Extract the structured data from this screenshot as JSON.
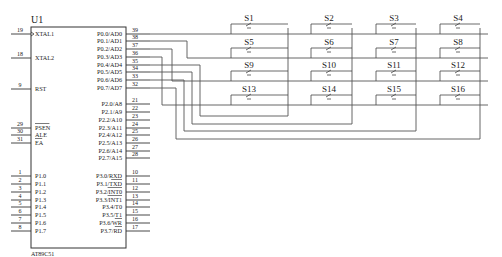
{
  "chip": {
    "ref": "U1",
    "part": "AT89C51",
    "left_pins": [
      {
        "num": "19",
        "name": "XTAL1",
        "y": 34,
        "clock": true
      },
      {
        "num": "18",
        "name": "XTAL2",
        "y": 58
      },
      {
        "num": "9",
        "name": "RST",
        "y": 89
      },
      {
        "num": "29",
        "name": "PSEN",
        "y": 128,
        "overbar": true
      },
      {
        "num": "30",
        "name": "ALE",
        "y": 135
      },
      {
        "num": "31",
        "name": "EA",
        "y": 143,
        "overbar": true
      },
      {
        "num": "1",
        "name": "P1.0",
        "y": 176
      },
      {
        "num": "2",
        "name": "P1.1",
        "y": 184
      },
      {
        "num": "3",
        "name": "P1.2",
        "y": 192
      },
      {
        "num": "4",
        "name": "P1.3",
        "y": 200
      },
      {
        "num": "5",
        "name": "P1.4",
        "y": 207
      },
      {
        "num": "6",
        "name": "P1.5",
        "y": 215
      },
      {
        "num": "7",
        "name": "P1.6",
        "y": 223
      },
      {
        "num": "8",
        "name": "P1.7",
        "y": 231
      }
    ],
    "right_pins": [
      {
        "num": "39",
        "name": "P0.0/AD0",
        "y": 34
      },
      {
        "num": "38",
        "name": "P0.1/AD1",
        "y": 41
      },
      {
        "num": "37",
        "name": "P0.2/AD2",
        "y": 49
      },
      {
        "num": "36",
        "name": "P0.3/AD3",
        "y": 57
      },
      {
        "num": "35",
        "name": "P0.4/AD4",
        "y": 65
      },
      {
        "num": "34",
        "name": "P0.5/AD5",
        "y": 72
      },
      {
        "num": "33",
        "name": "P0.6/AD6",
        "y": 80
      },
      {
        "num": "32",
        "name": "P0.7/AD7",
        "y": 88
      },
      {
        "num": "21",
        "name": "P2.0/A8",
        "y": 104
      },
      {
        "num": "22",
        "name": "P2.1/A9",
        "y": 112
      },
      {
        "num": "23",
        "name": "P2.2/A10",
        "y": 120
      },
      {
        "num": "24",
        "name": "P2.3/A11",
        "y": 128
      },
      {
        "num": "25",
        "name": "P2.4/A12",
        "y": 135
      },
      {
        "num": "26",
        "name": "P2.5/A13",
        "y": 143
      },
      {
        "num": "27",
        "name": "P2.6/A14",
        "y": 151
      },
      {
        "num": "28",
        "name": "P2.7/A15",
        "y": 158
      },
      {
        "num": "10",
        "name": "P3.0/RXD",
        "y": 176
      },
      {
        "num": "11",
        "name": "P3.1/TXD",
        "y": 184,
        "overbar_part": "TXD"
      },
      {
        "num": "12",
        "name": "P3.2/INT0",
        "y": 192,
        "overbar_part": "INT0"
      },
      {
        "num": "13",
        "name": "P3.3/INT1",
        "y": 200,
        "overbar_part": "INT1"
      },
      {
        "num": "14",
        "name": "P3.4/T0",
        "y": 207
      },
      {
        "num": "15",
        "name": "P3.5/T1",
        "y": 215
      },
      {
        "num": "16",
        "name": "P3.6/WR",
        "y": 223,
        "overbar_part": "WR"
      },
      {
        "num": "17",
        "name": "P3.7/RD",
        "y": 231,
        "overbar_part": "RD"
      }
    ]
  },
  "keypad": {
    "switches": [
      [
        "S1",
        "S2",
        "S3",
        "S4"
      ],
      [
        "S5",
        "S6",
        "S7",
        "S8"
      ],
      [
        "S9",
        "S10",
        "S11",
        "S12"
      ],
      [
        "S13",
        "S14",
        "S15",
        "S16"
      ]
    ],
    "row_y": [
      34,
      58,
      81,
      105
    ],
    "col_switch_x": [
      249,
      329,
      394,
      458
    ],
    "col_bus_x": [
      288,
      352,
      416,
      480
    ],
    "col_return_y": [
      116,
      124,
      131,
      139
    ]
  },
  "colors": {
    "wire": "#555555",
    "text": "#222222",
    "background": "#ffffff"
  }
}
